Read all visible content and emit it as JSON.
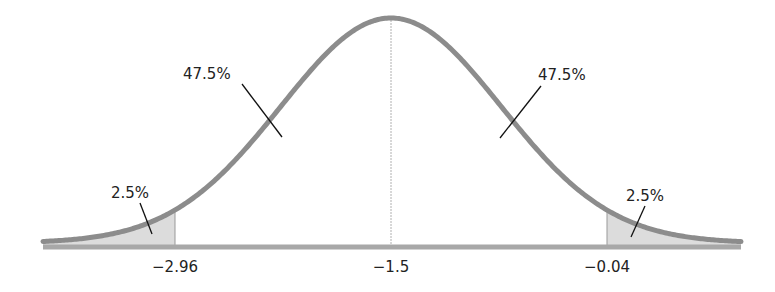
{
  "chart_data": {
    "type": "area",
    "title": "",
    "subtitle": "",
    "xlabel": "",
    "ylabel": "",
    "distribution": "normal",
    "mean": -1.5,
    "sd": 0.745,
    "grid": false,
    "legend": null,
    "xlim": [
      -3.99,
      0.99
    ],
    "tick_labels": [
      "−2.96",
      "−1.5",
      "−0.04"
    ],
    "ticks": [
      -2.96,
      -1.5,
      -0.04
    ],
    "shaded_regions": [
      {
        "name": "left-tail",
        "from": -3.99,
        "to": -2.96,
        "percent": 2.5
      },
      {
        "name": "right-tail",
        "from": -0.04,
        "to": 0.99,
        "percent": 2.5
      }
    ],
    "annotations": [
      {
        "region": "left-tail",
        "label": "2.5%"
      },
      {
        "region": "left-middle",
        "label": "47.5%"
      },
      {
        "region": "right-middle",
        "label": "47.5%"
      },
      {
        "region": "right-tail",
        "label": "2.5%"
      }
    ],
    "areas": [
      {
        "region": "x < -2.96",
        "percent": 2.5
      },
      {
        "region": "-2.96 to -1.5",
        "percent": 47.5
      },
      {
        "region": "-1.5 to -0.04",
        "percent": 47.5
      },
      {
        "region": "x > -0.04",
        "percent": 2.5
      }
    ]
  },
  "labels": {
    "tick_left": "−2.96",
    "tick_center": "−1.5",
    "tick_right": "−0.04",
    "pct_left_tail": "2.5%",
    "pct_left_mid": "47.5%",
    "pct_right_mid": "47.5%",
    "pct_right_tail": "2.5%"
  },
  "colors": {
    "curve": "#8c8c8c",
    "axis": "#a8a8a8",
    "tail_fill": "#dcdcdc",
    "center_line": "#b0b0b0",
    "cutoff_line": "#999999",
    "leader_line": "#111111",
    "text": "#222222"
  }
}
